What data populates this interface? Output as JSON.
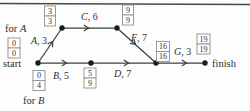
{
  "colors": {
    "background": "#fdfdfd",
    "line": "#3e3e3e",
    "top_rule": "#474747",
    "box_border": "#8f8f8f",
    "box_fill": "#ffffff",
    "text": "#2e2e2e",
    "node_fill": "#1c1c1c"
  },
  "diagram": {
    "type": "activity-network",
    "node_labels": {
      "start": "start",
      "finish": "finish"
    },
    "side_labels": {
      "for_a": {
        "prefix": "for ",
        "letter": "A"
      },
      "for_b": {
        "prefix": "for ",
        "letter": "B"
      }
    },
    "edges": {
      "a": {
        "letter": "A",
        "suffix": ", 3"
      },
      "b": {
        "letter": "B",
        "suffix": ", 5"
      },
      "c": {
        "letter": "C",
        "suffix": ", 6"
      },
      "d": {
        "letter": "D",
        "suffix": ", 7"
      },
      "f": {
        "letter": "F",
        "suffix": ", 7"
      },
      "g": {
        "letter": "G",
        "suffix": ", 3"
      }
    },
    "time_boxes": {
      "for_a": {
        "top": "0",
        "bottom": "0"
      },
      "after_a": {
        "top": "3",
        "bottom": "3"
      },
      "after_c": {
        "top": "9",
        "bottom": "9"
      },
      "for_b": {
        "top": "0",
        "bottom": "4"
      },
      "after_b": {
        "top": "5",
        "bottom": "9"
      },
      "after_d": {
        "top": "16",
        "bottom": "16"
      },
      "after_g": {
        "top": "19",
        "bottom": "19"
      }
    }
  }
}
